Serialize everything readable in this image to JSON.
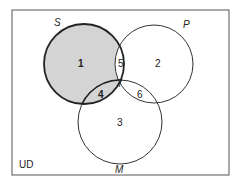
{
  "diagram": {
    "type": "venn",
    "universe_label": "UD",
    "sets": [
      {
        "name": "S",
        "label": "S",
        "cx": 84,
        "cy": 64,
        "r": 40,
        "emphasized": true
      },
      {
        "name": "P",
        "label": "P",
        "cx": 154,
        "cy": 64,
        "r": 39
      },
      {
        "name": "M",
        "label": "M",
        "cx": 120,
        "cy": 122,
        "r": 42
      }
    ],
    "regions": [
      {
        "id": "1",
        "label": "1",
        "x": 80,
        "y": 67,
        "shaded": true,
        "bold": true
      },
      {
        "id": "2",
        "label": "2",
        "x": 157,
        "y": 67,
        "shaded": false
      },
      {
        "id": "3",
        "label": "3",
        "x": 119,
        "y": 124,
        "shaded": false
      },
      {
        "id": "4",
        "label": "4",
        "x": 100,
        "y": 98,
        "shaded": true,
        "bold": true
      },
      {
        "id": "5",
        "label": "5",
        "x": 120,
        "y": 66,
        "shaded": false
      },
      {
        "id": "6",
        "label": "6",
        "x": 139,
        "y": 98,
        "shaded": false
      },
      {
        "id": "7",
        "label": "7",
        "x": 120,
        "y": 87,
        "shaded": false
      }
    ],
    "colors": {
      "shade": "#d4d4d4",
      "stroke": "#333333",
      "border": "#555555"
    }
  }
}
